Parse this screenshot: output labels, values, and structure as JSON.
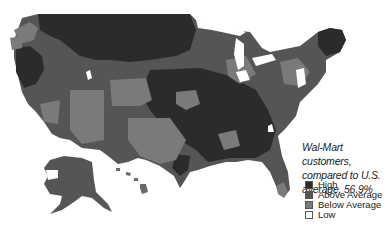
{
  "map": {
    "title": "Wal-Mart customers, compared to U.S. average, 56.9%",
    "caption_lines": [
      "Wal-Mart customers,",
      "compared to U.S.",
      "average, 56.9%"
    ],
    "region": "United States (incl. Alaska and Hawaii)",
    "legend": [
      {
        "label": "High",
        "color": "#2b2b2b"
      },
      {
        "label": "Above Average",
        "color": "#555555"
      },
      {
        "label": "Below Average",
        "color": "#7a7a7a"
      },
      {
        "label": "Low",
        "color": "#ffffff"
      }
    ]
  }
}
